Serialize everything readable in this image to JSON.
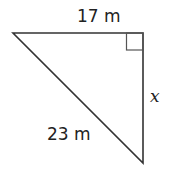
{
  "diagram": {
    "type": "right-triangle",
    "stroke_color": "#333333",
    "vertices": {
      "top_left": [
        13,
        33
      ],
      "right_angle": [
        143,
        33
      ],
      "bottom": [
        143,
        163
      ]
    },
    "right_angle_marker": {
      "x": 126,
      "y": 33,
      "size": 17
    },
    "labels": {
      "top_side": "17 m",
      "right_side": "x",
      "hypotenuse": "23 m"
    }
  }
}
